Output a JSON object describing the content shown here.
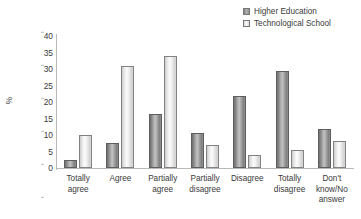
{
  "chart_data": {
    "type": "bar",
    "title": "",
    "xlabel": "",
    "ylabel": "%",
    "ylim": [
      0,
      40
    ],
    "yticks": [
      40,
      35,
      30,
      25,
      20,
      15,
      10,
      5,
      0
    ],
    "grid": false,
    "legend_position": "top-right",
    "categories": [
      "Totally agree",
      "Agree",
      "Partially agree",
      "Partially disagree",
      "Disagree",
      "Totally disagree",
      "Don't know/No answer"
    ],
    "series": [
      {
        "name": "Higher Education",
        "color": "#9d9d9d",
        "values": [
          2.5,
          7.5,
          16.5,
          10.5,
          21.8,
          29.5,
          11.8
        ]
      },
      {
        "name": "Technological School",
        "color": "#efefef",
        "values": [
          10.0,
          31.0,
          34.0,
          7.0,
          4.0,
          5.5,
          8.3
        ]
      }
    ]
  },
  "category_lines": [
    [
      "Totally",
      "agree"
    ],
    [
      "Agree"
    ],
    [
      "Partially",
      "agree"
    ],
    [
      "Partially",
      "disagree"
    ],
    [
      "Disagree"
    ],
    [
      "Totally",
      "disagree"
    ],
    [
      "Don't",
      "know/No",
      "answer"
    ]
  ]
}
